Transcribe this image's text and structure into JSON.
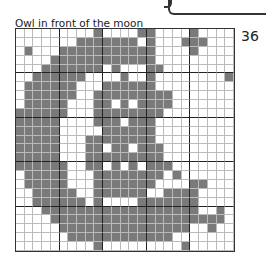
{
  "page": {
    "title": "Owl in front of the moon",
    "number": "36"
  },
  "puzzle": {
    "rows": 25,
    "cols": 25,
    "major_every": 5,
    "colors": {
      "filled": "#7a7a7a",
      "empty": "#ffffff",
      "grid_minor": "#bbbbbb",
      "grid_major": "#222222"
    },
    "grid": [
      "0000000001000011000010000",
      "0000000111111101000111000",
      "0100011111111111000010000",
      "0000111111111111000000000",
      "0001111111010001100000000",
      "0011111100001001000000001",
      "0111111000111111000000000",
      "0111111001111111110000000",
      "0111110001101011110000000",
      "1111110001111111100000000",
      "1111100001110111000000000",
      "1111100000111111000000000",
      "1111100011111111000000000",
      "1111100011011011100000000",
      "1111100011111111100000000",
      "1111110011010101110000000",
      "0111110001111111101000000",
      "0111110001111111000011000",
      "0011111001111110011110000",
      "0011111101000011111110000",
      "0001111111111111111110010",
      "0000111111111111111111110",
      "0000011111111111111100100",
      "0000001111111111110000000",
      "0000000001000000000100000"
    ]
  }
}
